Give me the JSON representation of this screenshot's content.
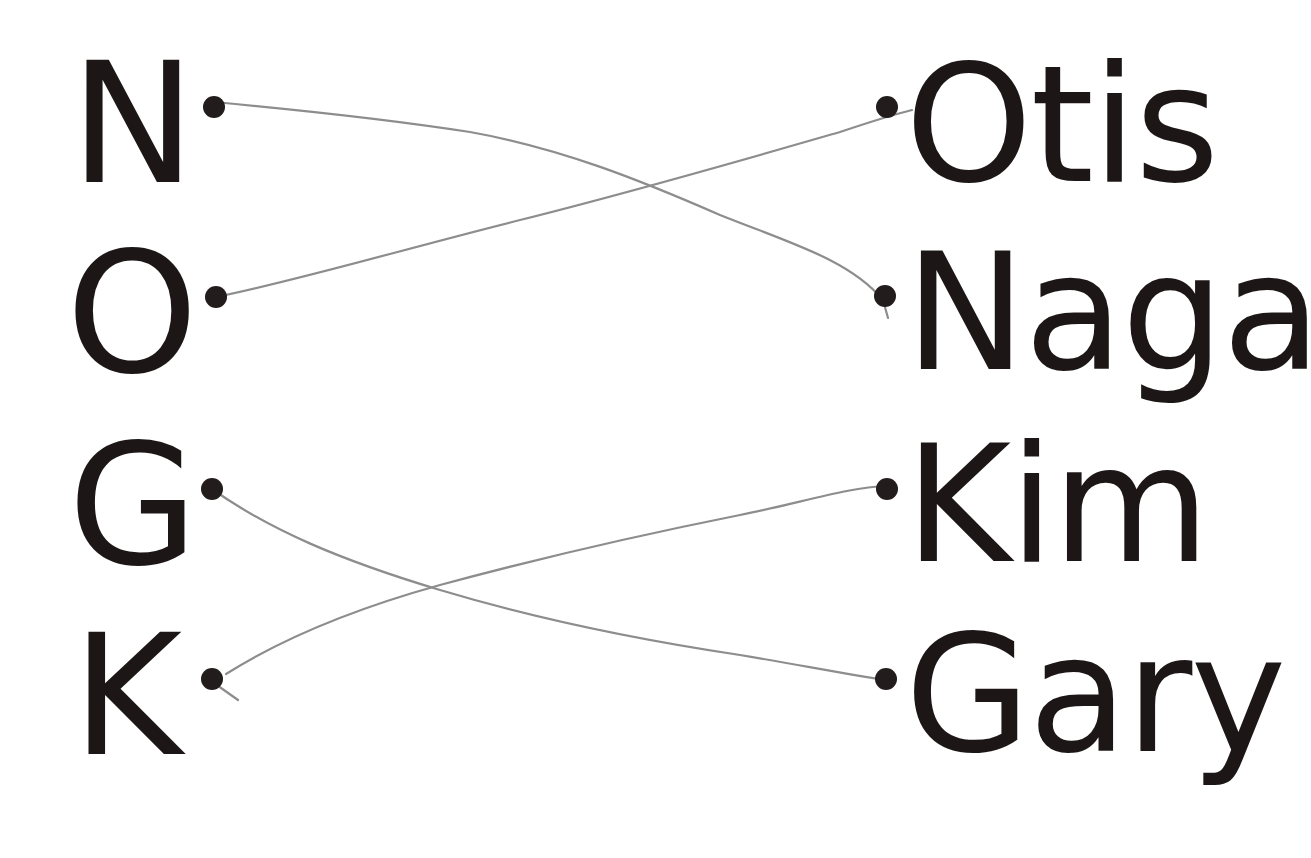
{
  "worksheet": {
    "type": "matching exercise",
    "letters": [
      {
        "label": "N",
        "dot": [
          214,
          107
        ]
      },
      {
        "label": "O",
        "dot": [
          216,
          297
        ]
      },
      {
        "label": "G",
        "dot": [
          212,
          489
        ]
      },
      {
        "label": "K",
        "dot": [
          212,
          679
        ]
      }
    ],
    "names": [
      {
        "label": "Otis",
        "dot": [
          887,
          107
        ]
      },
      {
        "label": "Naga",
        "dot": [
          885,
          296
        ]
      },
      {
        "label": "Kim",
        "dot": [
          887,
          489
        ]
      },
      {
        "label": "Gary",
        "dot": [
          886,
          679
        ]
      }
    ],
    "connections": [
      {
        "from": "N",
        "to": "Naga"
      },
      {
        "from": "O",
        "to": "Otis"
      },
      {
        "from": "G",
        "to": "Gary"
      },
      {
        "from": "K",
        "to": "Kim"
      }
    ],
    "colors": {
      "ink": "#1c1616",
      "pencil": "#8d8d8d",
      "paper": "#ffffff"
    }
  }
}
